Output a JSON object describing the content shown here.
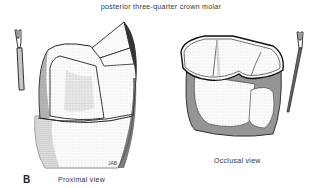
{
  "figure": {
    "title": "posterior three-quarter crown molar",
    "panel_label": "B",
    "artist_initials": "JAB",
    "views": [
      {
        "id": "proximal",
        "caption": "Proximal view"
      },
      {
        "id": "occlusal",
        "caption": "Occlusal view"
      }
    ],
    "colors": {
      "ink": "#1a1a1a",
      "stipple_light": "#d6d6d6",
      "stipple_dark": "#8a8a8a",
      "background": "#ffffff"
    }
  }
}
